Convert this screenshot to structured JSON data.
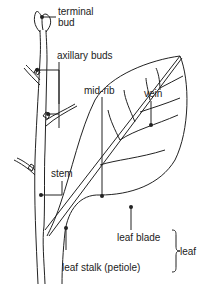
{
  "diagram": {
    "labels": {
      "terminal_bud_1": "terminal",
      "terminal_bud_2": "bud",
      "axillary_buds": "axillary buds",
      "mid_rib": "mid-rib",
      "vein": "vein",
      "stem": "stem",
      "leaf_blade": "leaf blade",
      "leaf_stalk": "leaf stalk (petiole)",
      "leaf": "leaf"
    },
    "colors": {
      "line": "#222222",
      "background": "#ffffff"
    }
  }
}
